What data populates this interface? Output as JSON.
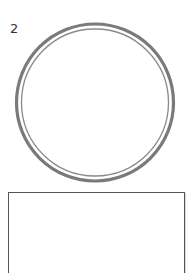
{
  "item": {
    "number_label": "2"
  },
  "colors": {
    "ring_outer": "#7a7a7a",
    "ring_inner": "#8a8a8a",
    "box_border": "#555555",
    "text": "#333333"
  }
}
